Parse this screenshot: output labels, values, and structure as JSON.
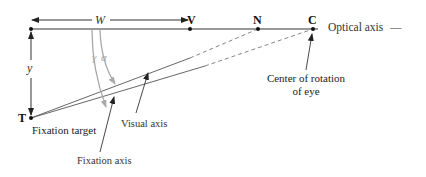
{
  "points": {
    "V": "V",
    "N": "N",
    "C": "C",
    "T": "T"
  },
  "dimensions": {
    "W": "W",
    "y": "y"
  },
  "angles": {
    "gamma": "γ",
    "alpha": "α"
  },
  "labels": {
    "optical_axis": "Optical axis",
    "optical_axis_dash": "—",
    "center_line1": "Center of rotation",
    "center_line2": "of eye",
    "fixation_target": "Fixation target",
    "visual_axis": "Visual axis",
    "fixation_axis": "Fixation axis"
  },
  "colors": {
    "line": "#333333",
    "angle_arrow": "#a8a8a8",
    "dashed": "#777777"
  }
}
